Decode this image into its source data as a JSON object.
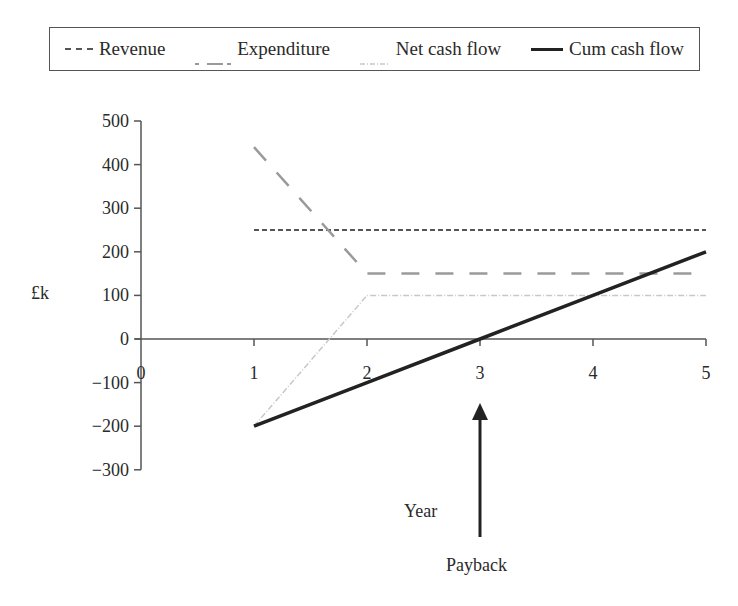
{
  "chart_data": {
    "type": "line",
    "title": "",
    "xlabel": "Year",
    "ylabel": "£k",
    "xlim": [
      0,
      5
    ],
    "ylim": [
      -300,
      500
    ],
    "x_ticks": [
      "0",
      "1",
      "2",
      "3",
      "4",
      "5"
    ],
    "y_ticks": [
      "500",
      "400",
      "300",
      "200",
      "100",
      "0",
      "−100",
      "−200",
      "−300"
    ],
    "y_tick_values": [
      500,
      400,
      300,
      200,
      100,
      0,
      -100,
      -200,
      -300
    ],
    "grid": false,
    "legend_position": "top",
    "series": [
      {
        "name": "Revenue",
        "style": "short-dash",
        "color": "#555555",
        "width": 2,
        "x": [
          1,
          2,
          3,
          4,
          5
        ],
        "values": [
          250,
          250,
          250,
          250,
          250
        ]
      },
      {
        "name": "Expenditure",
        "style": "long-dash",
        "color": "#9a9a9a",
        "width": 2.5,
        "x": [
          1,
          2,
          3,
          4,
          5
        ],
        "values": [
          440,
          150,
          150,
          150,
          150
        ]
      },
      {
        "name": "Net cash flow",
        "style": "dash-dot",
        "color": "#c8c8c8",
        "width": 1.5,
        "x": [
          1,
          2,
          3,
          4,
          5
        ],
        "values": [
          -200,
          100,
          100,
          100,
          100
        ]
      },
      {
        "name": "Cum cash flow",
        "style": "solid",
        "color": "#222222",
        "width": 3.5,
        "x": [
          1,
          2,
          3,
          4,
          5
        ],
        "values": [
          -200,
          -100,
          0,
          100,
          200
        ]
      }
    ],
    "annotations": [
      {
        "text": "Payback",
        "x": 3,
        "type": "arrow-up"
      }
    ]
  },
  "legend": {
    "items": [
      {
        "label": "Revenue"
      },
      {
        "label": "Expenditure"
      },
      {
        "label": "Net cash flow"
      },
      {
        "label": "Cum cash flow"
      }
    ]
  },
  "labels": {
    "ylabel": "£k",
    "xlabel": "Year",
    "payback": "Payback"
  }
}
